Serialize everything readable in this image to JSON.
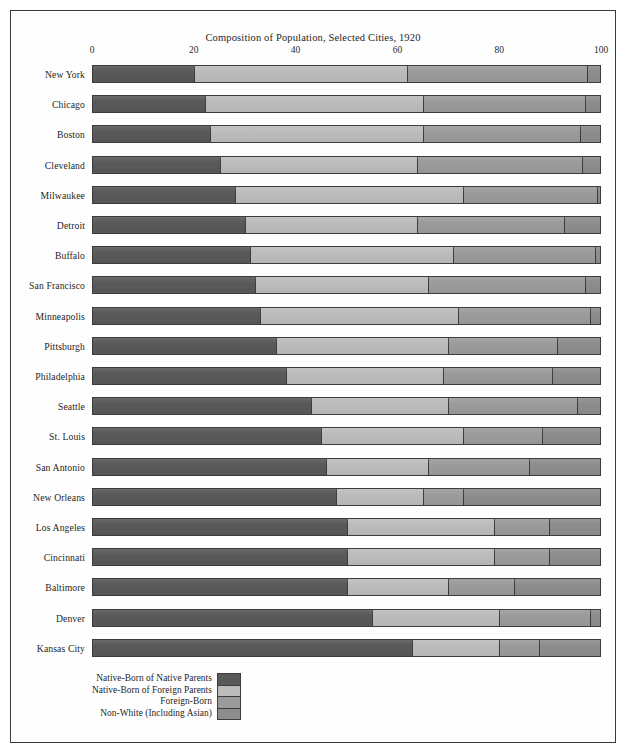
{
  "figure": {
    "title": "Composition of Population, Selected Cities, 1920"
  },
  "chart_data": {
    "type": "bar",
    "orientation": "horizontal",
    "stacked": true,
    "normalized": true,
    "title": "Composition of Population, Selected Cities, 1920",
    "xlabel": "",
    "ylabel": "",
    "xlim": [
      0,
      100
    ],
    "xticks": [
      "0",
      "20",
      "40",
      "60",
      "80",
      "100"
    ],
    "xtick_values": [
      0,
      20,
      40,
      60,
      80,
      100
    ],
    "grid": false,
    "legend_position": "bottom-left",
    "legend": [
      "Native-Born of Native Parents",
      "Native-Born of Foreign Parents",
      "Foreign-Born",
      "Non-White (Including Asian)"
    ],
    "colors": [
      "#595959",
      "#bcbcbc",
      "#9b9b9b",
      "#8d8d8d"
    ],
    "categories": [
      "New York",
      "Chicago",
      "Boston",
      "Cleveland",
      "Milwaukee",
      "Detroit",
      "Buffalo",
      "San Francisco",
      "Minneapolis",
      "Pittsburgh",
      "Philadelphia",
      "Seattle",
      "St. Louis",
      "San Antonio",
      "New Orleans",
      "Los Angeles",
      "Cincinnati",
      "Baltimore",
      "Denver",
      "Kansas City"
    ],
    "series": [
      {
        "name": "Native-Born of Native Parents",
        "values": [
          20,
          22,
          23,
          25,
          28,
          30,
          31,
          32,
          33,
          36,
          38,
          43,
          45,
          46,
          48,
          50,
          50,
          50,
          55,
          63
        ]
      },
      {
        "name": "Native-Born of Foreign Parents",
        "values": [
          42,
          43,
          42,
          39,
          45,
          34,
          40,
          34,
          39,
          34,
          31,
          27,
          28,
          20,
          17,
          29,
          29,
          20,
          25,
          17
        ]
      },
      {
        "name": "Foreign-Born",
        "values": [
          35.5,
          32,
          31,
          32.5,
          26.5,
          29,
          28,
          31,
          26,
          21.5,
          21.5,
          25.5,
          15.5,
          20,
          8,
          11,
          11,
          13,
          18,
          8
        ]
      },
      {
        "name": "Non-White (Including Asian)",
        "values": [
          2.5,
          3,
          4,
          3.5,
          0.5,
          7,
          1,
          3,
          2,
          8.5,
          9.5,
          4.5,
          11.5,
          14,
          27,
          10,
          10,
          17,
          2,
          12
        ]
      }
    ],
    "rows": [
      {
        "city": "New York",
        "segments": [
          20,
          42,
          35.5,
          2.5
        ]
      },
      {
        "city": "Chicago",
        "segments": [
          22,
          43,
          32,
          3
        ]
      },
      {
        "city": "Boston",
        "segments": [
          23,
          42,
          31,
          4
        ]
      },
      {
        "city": "Cleveland",
        "segments": [
          25,
          39,
          32.5,
          3.5
        ]
      },
      {
        "city": "Milwaukee",
        "segments": [
          28,
          45,
          26.5,
          0.5
        ]
      },
      {
        "city": "Detroit",
        "segments": [
          30,
          34,
          29,
          7
        ]
      },
      {
        "city": "Buffalo",
        "segments": [
          31,
          40,
          28,
          1
        ]
      },
      {
        "city": "San Francisco",
        "segments": [
          32,
          34,
          31,
          3
        ]
      },
      {
        "city": "Minneapolis",
        "segments": [
          33,
          39,
          26,
          2
        ]
      },
      {
        "city": "Pittsburgh",
        "segments": [
          36,
          34,
          21.5,
          8.5
        ]
      },
      {
        "city": "Philadelphia",
        "segments": [
          38,
          31,
          21.5,
          9.5
        ]
      },
      {
        "city": "Seattle",
        "segments": [
          43,
          27,
          25.5,
          4.5
        ]
      },
      {
        "city": "St. Louis",
        "segments": [
          45,
          28,
          15.5,
          11.5
        ]
      },
      {
        "city": "San Antonio",
        "segments": [
          46,
          20,
          20,
          14
        ]
      },
      {
        "city": "New Orleans",
        "segments": [
          48,
          17,
          8,
          27
        ]
      },
      {
        "city": "Los Angeles",
        "segments": [
          50,
          29,
          11,
          10
        ]
      },
      {
        "city": "Cincinnati",
        "segments": [
          50,
          29,
          11,
          10
        ]
      },
      {
        "city": "Baltimore",
        "segments": [
          50,
          20,
          13,
          17
        ]
      },
      {
        "city": "Denver",
        "segments": [
          55,
          25,
          18,
          2
        ]
      },
      {
        "city": "Kansas City",
        "segments": [
          63,
          17,
          8,
          12
        ]
      }
    ]
  }
}
